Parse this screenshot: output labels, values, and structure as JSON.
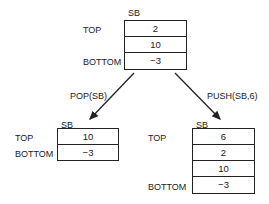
{
  "initial": {
    "name": "SB",
    "top_label": "TOP",
    "bottom_label": "BOTTOM",
    "cells": [
      "2",
      "10",
      "−3"
    ]
  },
  "pop": {
    "operation": "POP(SB)",
    "name": "SB",
    "top_label": "TOP",
    "bottom_label": "BOTTOM",
    "cells": [
      "10",
      "−3"
    ]
  },
  "push": {
    "operation": "PUSH(SB,6)",
    "name": "SB",
    "top_label": "TOP",
    "bottom_label": "BOTTOM",
    "cells": [
      "6",
      "2",
      "10",
      "−3"
    ]
  }
}
